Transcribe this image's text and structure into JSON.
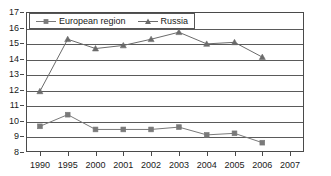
{
  "chart_data": {
    "type": "line",
    "title": "",
    "xlabel": "",
    "ylabel": "",
    "categories": [
      "1990",
      "1995",
      "2000",
      "2001",
      "2002",
      "2003",
      "2004",
      "2005",
      "2006",
      "2007"
    ],
    "ylim": [
      8,
      17
    ],
    "yticks": [
      8,
      9,
      10,
      11,
      12,
      13,
      14,
      15,
      16,
      17
    ],
    "grid": true,
    "legend_position": "top-left",
    "series": [
      {
        "name": "European region",
        "marker": "square",
        "color": "#7a7a7a",
        "values": [
          9.65,
          10.4,
          9.45,
          9.45,
          9.45,
          9.6,
          9.1,
          9.2,
          8.6,
          null
        ]
      },
      {
        "name": "Russia",
        "marker": "triangle",
        "color": "#6b6b6b",
        "values": [
          11.9,
          15.25,
          14.65,
          14.85,
          15.25,
          15.7,
          14.95,
          15.05,
          14.1,
          null
        ]
      }
    ]
  },
  "legend": {
    "entries": [
      {
        "label": "European region"
      },
      {
        "label": "Russia"
      }
    ]
  },
  "colors": {
    "axis": "#4a4a4a",
    "grid": "#5a5a5a",
    "series_european": "#7a7a7a",
    "series_russia": "#6b6b6b",
    "text": "#1a1a1a"
  }
}
